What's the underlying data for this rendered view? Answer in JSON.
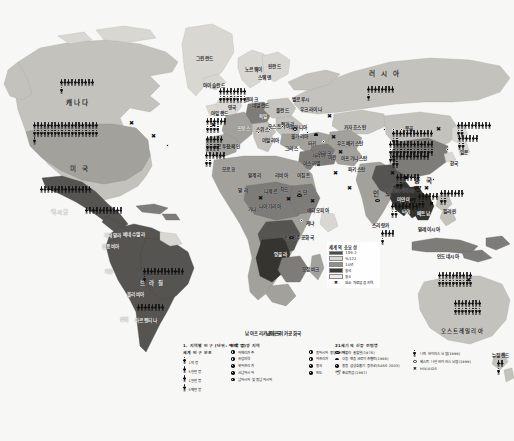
{
  "map": {
    "caption": "남아프리카공화국",
    "continent_labels": [
      {
        "name": "캐나다",
        "x": 66,
        "y": 97,
        "cls": "big"
      },
      {
        "name": "미 국",
        "x": 70,
        "y": 163,
        "cls": "big"
      },
      {
        "name": "멕시코",
        "x": 51,
        "y": 208,
        "cls": "mid lt"
      },
      {
        "name": "과테말라",
        "x": 104,
        "y": 232,
        "cls": "lt"
      },
      {
        "name": "콜롬비아",
        "x": 102,
        "y": 243,
        "cls": "lt"
      },
      {
        "name": "베네수엘라",
        "x": 123,
        "y": 231,
        "cls": "lt"
      },
      {
        "name": "페루",
        "x": 105,
        "y": 268,
        "cls": "lt"
      },
      {
        "name": "브 라 질",
        "x": 140,
        "y": 279,
        "cls": "mid lt"
      },
      {
        "name": "볼리비아",
        "x": 127,
        "y": 291,
        "cls": "lt"
      },
      {
        "name": "아르헨티나",
        "x": 135,
        "y": 317,
        "cls": "lt"
      },
      {
        "name": "칠레",
        "x": 120,
        "y": 316,
        "cls": "lt"
      },
      {
        "name": "그린란드",
        "x": 196,
        "y": 55,
        "cls": ""
      },
      {
        "name": "아이슬란드",
        "x": 203,
        "y": 82,
        "cls": ""
      },
      {
        "name": "노르웨이",
        "x": 245,
        "y": 66,
        "cls": ""
      },
      {
        "name": "스웨덴",
        "x": 258,
        "y": 74,
        "cls": ""
      },
      {
        "name": "핀란드",
        "x": 268,
        "y": 63,
        "cls": ""
      },
      {
        "name": "덴마크",
        "x": 245,
        "y": 96,
        "cls": ""
      },
      {
        "name": "영국",
        "x": 228,
        "y": 104,
        "cls": ""
      },
      {
        "name": "아일랜드",
        "x": 211,
        "y": 110,
        "cls": ""
      },
      {
        "name": "네덜란드",
        "x": 252,
        "y": 102,
        "cls": ""
      },
      {
        "name": "독일",
        "x": 259,
        "y": 113,
        "cls": "lt"
      },
      {
        "name": "폴란드",
        "x": 276,
        "y": 107,
        "cls": ""
      },
      {
        "name": "우크라이나",
        "x": 300,
        "y": 106,
        "cls": ""
      },
      {
        "name": "벨로루시",
        "x": 292,
        "y": 96,
        "cls": ""
      },
      {
        "name": "프랑스",
        "x": 237,
        "y": 125,
        "cls": "lt"
      },
      {
        "name": "스위스",
        "x": 256,
        "y": 126,
        "cls": ""
      },
      {
        "name": "오스트리아",
        "x": 268,
        "y": 123,
        "cls": ""
      },
      {
        "name": "헝가리",
        "x": 281,
        "y": 121,
        "cls": ""
      },
      {
        "name": "루마니아",
        "x": 290,
        "y": 124,
        "cls": ""
      },
      {
        "name": "불가리아",
        "x": 291,
        "y": 133,
        "cls": ""
      },
      {
        "name": "이탈리아",
        "x": 262,
        "y": 137,
        "cls": ""
      },
      {
        "name": "스페인",
        "x": 227,
        "y": 143,
        "cls": ""
      },
      {
        "name": "포르투갈",
        "x": 213,
        "y": 143,
        "cls": ""
      },
      {
        "name": "그리스",
        "x": 285,
        "y": 145,
        "cls": ""
      },
      {
        "name": "터키",
        "x": 308,
        "y": 140,
        "cls": ""
      },
      {
        "name": "시리아",
        "x": 312,
        "y": 152,
        "cls": ""
      },
      {
        "name": "이스라엘",
        "x": 303,
        "y": 160,
        "cls": ""
      },
      {
        "name": "이집트",
        "x": 297,
        "y": 172,
        "cls": ""
      },
      {
        "name": "모로코",
        "x": 222,
        "y": 166,
        "cls": ""
      },
      {
        "name": "알제리",
        "x": 248,
        "y": 172,
        "cls": ""
      },
      {
        "name": "리비아",
        "x": 275,
        "y": 172,
        "cls": ""
      },
      {
        "name": "말 리",
        "x": 238,
        "y": 187,
        "cls": ""
      },
      {
        "name": "니제르",
        "x": 264,
        "y": 188,
        "cls": ""
      },
      {
        "name": "차드",
        "x": 280,
        "y": 186,
        "cls": ""
      },
      {
        "name": "수 단",
        "x": 297,
        "y": 189,
        "cls": ""
      },
      {
        "name": "나이지리아",
        "x": 259,
        "y": 203,
        "cls": ""
      },
      {
        "name": "에티오피아",
        "x": 307,
        "y": 207,
        "cls": ""
      },
      {
        "name": "가나",
        "x": 248,
        "y": 206,
        "cls": ""
      },
      {
        "name": "케냐",
        "x": 306,
        "y": 220,
        "cls": ""
      },
      {
        "name": "콩고민주공화국",
        "x": 283,
        "y": 234,
        "cls": ""
      },
      {
        "name": "앙골라",
        "x": 274,
        "y": 251,
        "cls": "lt"
      },
      {
        "name": "모잠비크",
        "x": 302,
        "y": 266,
        "cls": ""
      },
      {
        "name": "남아프리카공화국",
        "x": 266,
        "y": 330,
        "cls": ""
      },
      {
        "name": "러 시 아",
        "x": 369,
        "y": 68,
        "cls": "big"
      },
      {
        "name": "카자흐스탄",
        "x": 344,
        "y": 124,
        "cls": ""
      },
      {
        "name": "우즈베키스탄",
        "x": 337,
        "y": 140,
        "cls": ""
      },
      {
        "name": "아프가니스탄",
        "x": 341,
        "y": 155,
        "cls": ""
      },
      {
        "name": "이란",
        "x": 328,
        "y": 154,
        "cls": ""
      },
      {
        "name": "이라크",
        "x": 318,
        "y": 150,
        "cls": ""
      },
      {
        "name": "파키스탄",
        "x": 348,
        "y": 166,
        "cls": ""
      },
      {
        "name": "인 도",
        "x": 373,
        "y": 188,
        "cls": "big"
      },
      {
        "name": "몽골",
        "x": 405,
        "y": 125,
        "cls": ""
      },
      {
        "name": "중 국",
        "x": 414,
        "y": 175,
        "cls": "big"
      },
      {
        "name": "일본",
        "x": 460,
        "y": 149,
        "cls": ""
      },
      {
        "name": "한국",
        "x": 450,
        "y": 160,
        "cls": ""
      },
      {
        "name": "방글라데시",
        "x": 392,
        "y": 187,
        "cls": ""
      },
      {
        "name": "미얀마",
        "x": 397,
        "y": 196,
        "cls": "lt"
      },
      {
        "name": "타이",
        "x": 402,
        "y": 208,
        "cls": "lt"
      },
      {
        "name": "베트남",
        "x": 417,
        "y": 210,
        "cls": "lt"
      },
      {
        "name": "필리핀",
        "x": 443,
        "y": 208,
        "cls": ""
      },
      {
        "name": "스리랑카",
        "x": 372,
        "y": 222,
        "cls": ""
      },
      {
        "name": "말레이시아",
        "x": 418,
        "y": 226,
        "cls": ""
      },
      {
        "name": "인도네시아",
        "x": 437,
        "y": 253,
        "cls": ""
      },
      {
        "name": "오스트레일리아",
        "x": 441,
        "y": 327,
        "cls": "mid"
      },
      {
        "name": "뉴질랜드",
        "x": 492,
        "y": 352,
        "cls": ""
      }
    ],
    "figure_clusters": [
      {
        "region": "canada",
        "x": 60,
        "y": 79,
        "count": 11,
        "width": 36
      },
      {
        "region": "usa",
        "x": 33,
        "y": 122,
        "count": 39,
        "width": 66
      },
      {
        "region": "mexico",
        "x": 40,
        "y": 186,
        "count": 15,
        "width": 52
      },
      {
        "region": "central-america",
        "x": 85,
        "y": 207,
        "count": 11,
        "width": 38
      },
      {
        "region": "brazil",
        "x": 143,
        "y": 268,
        "count": 13,
        "width": 44
      },
      {
        "region": "argentina",
        "x": 137,
        "y": 304,
        "count": 8,
        "width": 28
      },
      {
        "region": "peru-bolivia",
        "x": 134,
        "y": 289,
        "count": 0,
        "width": 0
      },
      {
        "region": "north-europe",
        "x": 219,
        "y": 88,
        "count": 16,
        "width": 30
      },
      {
        "region": "uk-ireland",
        "x": 206,
        "y": 118,
        "count": 10,
        "width": 22
      },
      {
        "region": "france-iberia",
        "x": 206,
        "y": 136,
        "count": 9,
        "width": 20
      },
      {
        "region": "spain-portugal",
        "x": 205,
        "y": 152,
        "count": 8,
        "width": 22
      },
      {
        "region": "russia-west",
        "x": 367,
        "y": 86,
        "count": 9,
        "width": 30
      },
      {
        "region": "china-north",
        "x": 392,
        "y": 130,
        "count": 14,
        "width": 44
      },
      {
        "region": "china-main",
        "x": 389,
        "y": 141,
        "count": 28,
        "width": 46
      },
      {
        "region": "china-south",
        "x": 392,
        "y": 153,
        "count": 13,
        "width": 40
      },
      {
        "region": "japan",
        "x": 457,
        "y": 122,
        "count": 12,
        "width": 36
      },
      {
        "region": "korea-japan2",
        "x": 458,
        "y": 135,
        "count": 8,
        "width": 24
      },
      {
        "region": "india-north",
        "x": 396,
        "y": 174,
        "count": 9,
        "width": 26
      },
      {
        "region": "india-main",
        "x": 391,
        "y": 203,
        "count": 10,
        "width": 30
      },
      {
        "region": "indochina",
        "x": 418,
        "y": 193,
        "count": 8,
        "width": 22
      },
      {
        "region": "philippines",
        "x": 440,
        "y": 190,
        "count": 9,
        "width": 26
      },
      {
        "region": "indonesia",
        "x": 438,
        "y": 272,
        "count": 20,
        "width": 36
      },
      {
        "region": "australia",
        "x": 454,
        "y": 300,
        "count": 16,
        "width": 30
      },
      {
        "region": "srilanka",
        "x": 381,
        "y": 230,
        "count": 5,
        "width": 16
      },
      {
        "region": "sw-asia",
        "x": 497,
        "y": 360,
        "count": 3,
        "width": 10
      }
    ],
    "disease_markers": [
      {
        "kind": "x",
        "x": 129,
        "y": 120
      },
      {
        "kind": "x",
        "x": 151,
        "y": 133
      },
      {
        "kind": "dot",
        "x": 166,
        "y": 144
      },
      {
        "kind": "x",
        "x": 211,
        "y": 122
      },
      {
        "kind": "dot",
        "x": 257,
        "y": 131
      },
      {
        "kind": "dot",
        "x": 268,
        "y": 128
      },
      {
        "kind": "dot",
        "x": 281,
        "y": 125
      },
      {
        "kind": "ring",
        "x": 293,
        "y": 127
      },
      {
        "kind": "dot",
        "x": 306,
        "y": 131
      },
      {
        "kind": "cap",
        "x": 314,
        "y": 133
      },
      {
        "kind": "dot",
        "x": 322,
        "y": 140
      },
      {
        "kind": "x",
        "x": 331,
        "y": 134
      },
      {
        "kind": "x",
        "x": 258,
        "y": 195
      },
      {
        "kind": "x",
        "x": 286,
        "y": 196
      },
      {
        "kind": "ell",
        "x": 297,
        "y": 194
      },
      {
        "kind": "x",
        "x": 310,
        "y": 198
      },
      {
        "kind": "dot",
        "x": 300,
        "y": 219
      },
      {
        "kind": "ell",
        "x": 289,
        "y": 236
      },
      {
        "kind": "x",
        "x": 327,
        "y": 113
      },
      {
        "kind": "x",
        "x": 338,
        "y": 149
      },
      {
        "kind": "x",
        "x": 333,
        "y": 170
      },
      {
        "kind": "x",
        "x": 347,
        "y": 185
      },
      {
        "kind": "dot",
        "x": 383,
        "y": 128
      },
      {
        "kind": "dot",
        "x": 392,
        "y": 128
      },
      {
        "kind": "dot",
        "x": 400,
        "y": 128
      },
      {
        "kind": "x",
        "x": 390,
        "y": 170
      },
      {
        "kind": "ell",
        "x": 375,
        "y": 199
      },
      {
        "kind": "cap",
        "x": 404,
        "y": 176
      },
      {
        "kind": "bird",
        "x": 414,
        "y": 186
      },
      {
        "kind": "x",
        "x": 424,
        "y": 185
      },
      {
        "kind": "dot",
        "x": 432,
        "y": 178
      },
      {
        "kind": "bird",
        "x": 409,
        "y": 198
      },
      {
        "kind": "x",
        "x": 436,
        "y": 126
      },
      {
        "kind": "dot",
        "x": 446,
        "y": 148
      },
      {
        "kind": "x",
        "x": 466,
        "y": 277
      },
      {
        "kind": "sq",
        "x": 430,
        "y": 202
      }
    ],
    "hunger_legend": {
      "title": "세계의 충요성",
      "rows": [
        {
          "label": "159.2",
          "color": "#4a4a4a"
        },
        {
          "label": "%122",
          "color": "#d9d7d2"
        },
        {
          "label": "10년",
          "color": "#8f8f8a"
        },
        {
          "label": "충국",
          "color": "#3a3a3a"
        },
        {
          "label": "충4",
          "color": "#ecebe7"
        },
        {
          "label": "요소 자료없음 지역",
          "color": "#ffffff",
          "icon": "x"
        }
      ]
    }
  },
  "bottom_legend": {
    "caption": "남아프리카공화국",
    "col1": {
      "title": "1. 지역별 인구  (단위: 백만 명)",
      "subtitle": "세계 인구 분포",
      "items": [
        {
          "figs": 1,
          "label": "1억 명"
        },
        {
          "figs": 1,
          "label": "5천만 명"
        },
        {
          "figs": 1,
          "label": "1천만 명"
        },
        {
          "figs": 1,
          "label": "5백만 명"
        }
      ]
    },
    "col2": {
      "title": "인류 공영 지역",
      "items_left": [
        {
          "label": "아메리카주"
        },
        {
          "label": "유럽지역"
        },
        {
          "label": "북아프리카"
        },
        {
          "label": "서남아시아"
        },
        {
          "label": "남아시아 및 동남아시아"
        }
      ],
      "items_right": [
        {
          "label": "동아시아 중앙아시아"
        },
        {
          "label": "아프리카"
        },
        {
          "label": "중국"
        },
        {
          "label": "인도"
        }
      ]
    },
    "col3": {
      "title": "21세기의 신종 전염병",
      "items_left": [
        {
          "icon": "ellipse",
          "label": "에볼라 출혈열(1976)"
        },
        {
          "icon": "cap",
          "label": "신종 변종 크로이츠펠트(1996)"
        },
        {
          "icon": "bullet",
          "label": "중증 급성호흡기 증후군(SARS 2003)"
        },
        {
          "icon": "bird",
          "label": "조류독감(1997)"
        }
      ],
      "items_right": [
        {
          "icon": "fig",
          "label": "니파 바이러스 뇌염(1999)"
        },
        {
          "icon": "ring",
          "label": "웨스트 나일 바이러스 뇌염(1999)"
        },
        {
          "icon": "x",
          "label": "HIV/AIDS"
        }
      ]
    }
  }
}
